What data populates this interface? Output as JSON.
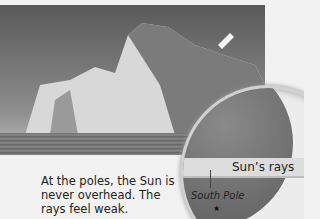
{
  "figure": {
    "photo_alt": "iceberg in polar sea",
    "inset": {
      "rays_label": "Sun’s rays",
      "pole_label": "South Pole"
    },
    "caption": "At the poles, the Sun is never overhead. The rays feel weak.",
    "marker": "★"
  }
}
